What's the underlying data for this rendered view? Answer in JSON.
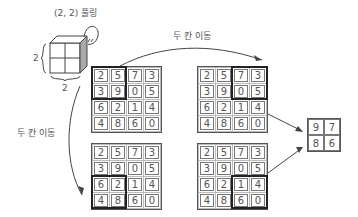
{
  "title": "(2, 2) 풀링",
  "kernel": {
    "width_label": "2",
    "height_label": "2"
  },
  "move_labels": {
    "horizontal": "두 칸 이동",
    "vertical": "두 칸 이동"
  },
  "input_matrix": [
    [
      2,
      5,
      7,
      3
    ],
    [
      3,
      9,
      0,
      5
    ],
    [
      6,
      2,
      1,
      4
    ],
    [
      4,
      8,
      6,
      0
    ]
  ],
  "grids": [
    {
      "name": "top-left",
      "highlight": "rows 0-1, cols 0-1"
    },
    {
      "name": "top-right",
      "highlight": "rows 0-1, cols 2-3"
    },
    {
      "name": "bottom-left",
      "highlight": "rows 2-3, cols 0-1"
    },
    {
      "name": "bottom-right",
      "highlight": "rows 2-3, cols 2-3"
    }
  ],
  "result_matrix": [
    [
      9,
      7
    ],
    [
      8,
      6
    ]
  ],
  "cells": {
    "g": [
      "2",
      "5",
      "7",
      "3",
      "3",
      "9",
      "0",
      "5",
      "6",
      "2",
      "1",
      "4",
      "4",
      "8",
      "6",
      "0"
    ],
    "r": [
      "9",
      "7",
      "8",
      "6"
    ]
  }
}
